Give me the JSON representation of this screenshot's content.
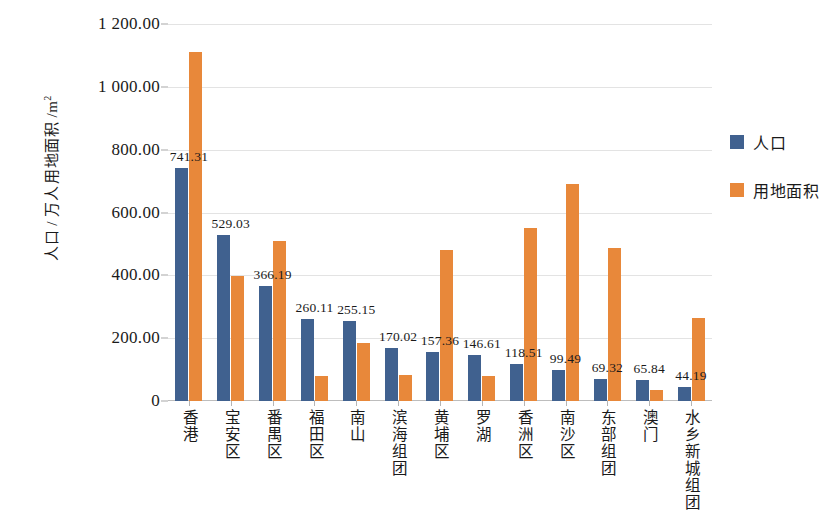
{
  "chart_data": {
    "type": "bar",
    "title": "",
    "subtitle": "",
    "xlabel": "",
    "ylabel": "人口 / 万人 用地面积 /m²",
    "ylabel_lines": [
      "人口 / 万人",
      "用地面积 /m"
    ],
    "ylabel_superscript": "2",
    "ylim": [
      0,
      1200
    ],
    "ytick_labels": [
      "1 200.00",
      "1 000.00",
      "800.00",
      "600.00",
      "400.00",
      "200.00",
      "0"
    ],
    "ytick_values": [
      1200,
      1000,
      800,
      600,
      400,
      200,
      0
    ],
    "grid": true,
    "legend_position": "right",
    "categories": [
      "香港",
      "宝安区",
      "番禺区",
      "福田区",
      "南山",
      "滨海组团",
      "黄埔区",
      "罗湖",
      "香洲区",
      "南沙区",
      "东部组团",
      "澳门",
      "水乡新城组团"
    ],
    "series": [
      {
        "name": "人口",
        "color": "#40618F",
        "values": [
          741.31,
          529.03,
          366.19,
          260.11,
          255.15,
          170.02,
          157.36,
          146.61,
          118.51,
          99.49,
          69.32,
          65.84,
          44.19
        ],
        "labels": [
          "741.31",
          "529.03",
          "366.19",
          "260.11",
          "255.15",
          "170.02",
          "157.36",
          "146.61",
          "118.51",
          "99.49",
          "69.32",
          "65.84",
          "44.19"
        ],
        "show_labels": true
      },
      {
        "name": "用地面积",
        "color": "#E8883A",
        "values": [
          1110,
          397,
          509,
          80,
          186,
          82,
          480,
          80,
          550,
          692,
          486,
          35,
          265
        ],
        "labels": [],
        "show_labels": false
      }
    ]
  },
  "legend": {
    "items": [
      {
        "label": "人口",
        "color": "#40618F"
      },
      {
        "label": "用地面积",
        "color": "#E8883A"
      }
    ]
  }
}
